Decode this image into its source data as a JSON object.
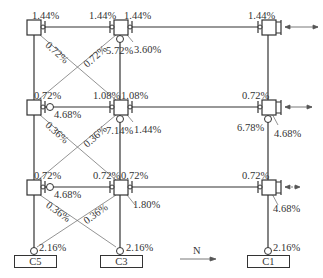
{
  "diagram": {
    "columns": [
      "C5",
      "C3",
      "C1"
    ],
    "north_label": "N",
    "row1": {
      "left_top": "1.44%",
      "mid_left_top": "1.44%",
      "mid_right_top": "1.44%",
      "mid_below": "5.72%",
      "mid_diag": "3.60%",
      "right_top": "1.44%",
      "brace_left": "0.72%",
      "brace_right": "0.72%"
    },
    "row2": {
      "left_top": "0.72%",
      "left_valve": "4.68%",
      "mid_left_top": "1.08%",
      "mid_right_top": "1.08%",
      "mid_below": "7.14%",
      "mid_diag": "1.44%",
      "right_top": "0.72%",
      "right_below": "6.78%",
      "right_diag": "4.68%",
      "brace_left": "0.36%",
      "brace_right": "0.36%"
    },
    "row3": {
      "left_top": "0.72%",
      "left_valve": "4.68%",
      "mid_left_top": "0.72%",
      "mid_right_top": "0.72%",
      "mid_diag": "1.80%",
      "right_top": "0.72%",
      "right_diag": "4.68%",
      "brace_left": "0.36%",
      "brace_right": "0.36%"
    },
    "foundations": [
      {
        "name": "C5",
        "value": "2.16%"
      },
      {
        "name": "C3",
        "value": "2.16%"
      },
      {
        "name": "C1",
        "value": "2.16%"
      }
    ]
  }
}
